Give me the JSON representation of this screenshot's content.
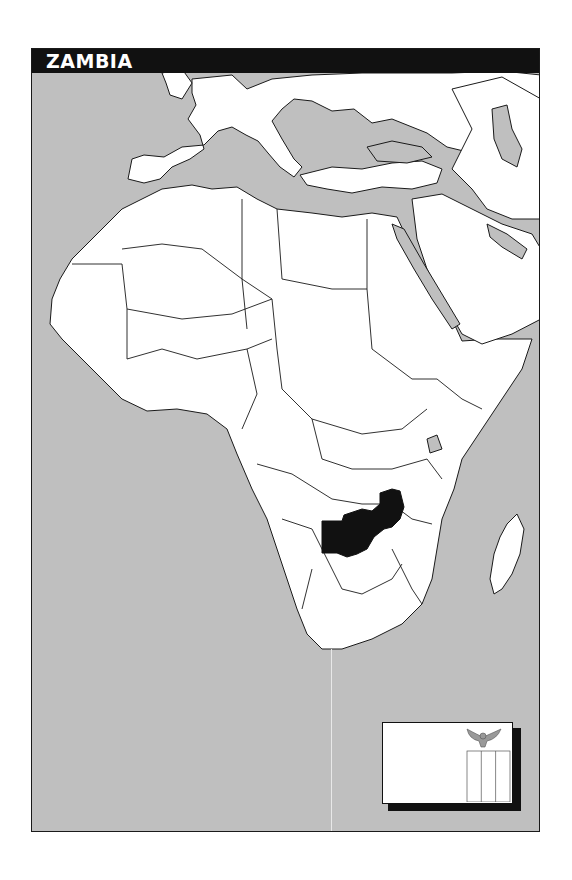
{
  "title": "ZAMBIA",
  "map": {
    "highlighted_country": "Zambia",
    "region_shown": "Africa, Europe and Middle East",
    "colors": {
      "ocean": "#bfbfbf",
      "land": "#ffffff",
      "border": "#1a1a1a",
      "highlight": "#111111",
      "title_bar": "#111111",
      "title_text": "#ffffff"
    }
  },
  "flag": {
    "country": "Zambia",
    "emblem": "eagle",
    "stripes": 3,
    "colors": {
      "field": "#ffffff",
      "outline": "#111111",
      "emblem": "#888888"
    }
  }
}
